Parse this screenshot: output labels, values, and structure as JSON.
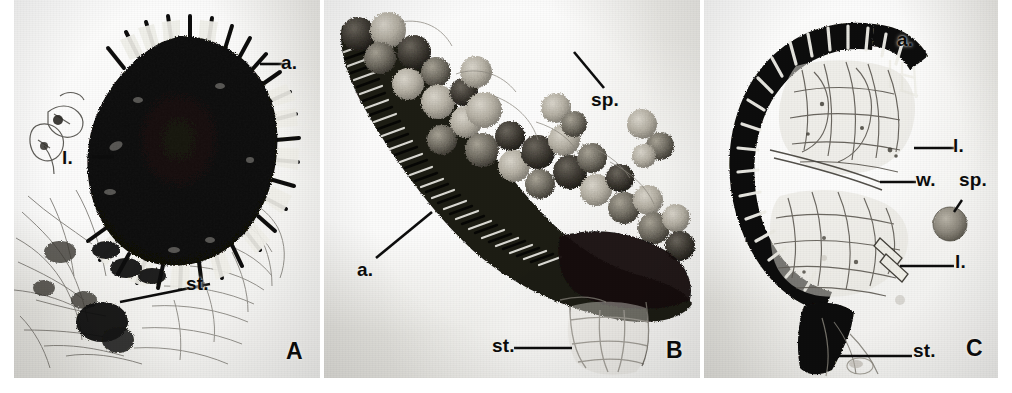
{
  "figure": {
    "kind": "light-micrograph-plate",
    "panel_count": 3,
    "background_color": "#ffffff",
    "plate_tone": "#e8e7e3",
    "ink_color": "#0d0d0d",
    "width_px": 1012,
    "height_px": 393
  },
  "legend_keys": {
    "a": "a.",
    "l": "l.",
    "w": "w.",
    "sp": "sp.",
    "st": "st."
  },
  "panels": [
    {
      "id": "A",
      "label": "A",
      "subject": "dark sporangium with radiating annulus cells and stalk",
      "annotations": [
        {
          "key": "a.",
          "name": "annulus",
          "text": "a.",
          "x": 281,
          "y": 60
        },
        {
          "key": "l.",
          "name": "lamella",
          "text": "l.",
          "x": 62,
          "y": 151
        },
        {
          "key": "st.",
          "name": "stalk",
          "text": "st.",
          "x": 186,
          "y": 279
        }
      ]
    },
    {
      "id": "B",
      "label": "B",
      "subject": "dehisced sporangium showing annulus ribs, released spores and stalk",
      "annotations": [
        {
          "key": "sp.",
          "name": "spore",
          "text": "sp.",
          "x": 591,
          "y": 96
        },
        {
          "key": "a.",
          "name": "annulus",
          "text": "a.",
          "x": 357,
          "y": 266
        },
        {
          "key": "st.",
          "name": "stalk",
          "text": "st.",
          "x": 492,
          "y": 341
        }
      ]
    },
    {
      "id": "C",
      "label": "C",
      "subject": "sectioned sporangium showing annulus, lamellae, wall and free spore",
      "annotations": [
        {
          "key": "a.",
          "name": "annulus",
          "text": "a.",
          "x": 897,
          "y": 36
        },
        {
          "key": "l.",
          "name": "lamella-upper",
          "text": "l.",
          "x": 953,
          "y": 141
        },
        {
          "key": "w.",
          "name": "wall",
          "text": "w.",
          "x": 918,
          "y": 174
        },
        {
          "key": "sp.",
          "name": "spore",
          "text": "sp.",
          "x": 961,
          "y": 176
        },
        {
          "key": "l2.",
          "name": "lamella-lower",
          "text": "l.",
          "x": 957,
          "y": 257
        },
        {
          "key": "st.",
          "name": "stalk",
          "text": "st.",
          "x": 915,
          "y": 346
        }
      ]
    }
  ],
  "panel_ids": [
    {
      "text": "A",
      "x": 286,
      "y": 348
    },
    {
      "text": "B",
      "x": 666,
      "y": 347
    },
    {
      "text": "C",
      "x": 966,
      "y": 345
    }
  ]
}
